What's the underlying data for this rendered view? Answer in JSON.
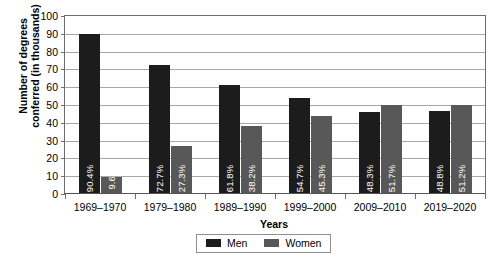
{
  "chart_data": {
    "type": "bar",
    "title": "",
    "xlabel": "Years",
    "ylabel": "Number of degrees conferred (in thousands)",
    "ylabel_line1": "Number of degrees",
    "ylabel_line2": "conferred (in thousands)",
    "categories": [
      "1969–1970",
      "1979–1980",
      "1989–1990",
      "1999–2000",
      "2009–2010",
      "2019–2020"
    ],
    "series": [
      {
        "name": "Men",
        "color": "#1c1c1c",
        "values": [
          90,
          72.5,
          61,
          54,
          46,
          46.5
        ],
        "labels": [
          "90.4%",
          "72.7%",
          "61.8%",
          "54.7%",
          "48.3%",
          "48.8%"
        ]
      },
      {
        "name": "Women",
        "color": "#585858",
        "values": [
          9.6,
          27,
          38,
          44,
          50,
          50
        ],
        "labels": [
          "9.6%",
          "27.3%",
          "38.2%",
          "45.3%",
          "51.7%",
          "51.2%"
        ]
      }
    ],
    "ylim": [
      0,
      100
    ],
    "yticks": [
      0,
      10,
      20,
      30,
      40,
      50,
      60,
      70,
      80,
      90,
      100
    ],
    "ytick_labels": [
      "0",
      "10",
      "20",
      "30",
      "40",
      "50",
      "60",
      "70",
      "80",
      "90",
      "100"
    ],
    "grid": true,
    "legend_position": "bottom-center"
  },
  "legend": {
    "entries": [
      {
        "label": "Men",
        "color": "#1c1c1c"
      },
      {
        "label": "Women",
        "color": "#585858"
      }
    ]
  }
}
